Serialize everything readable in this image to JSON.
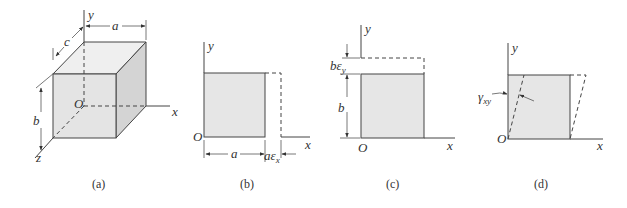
{
  "figures": [
    {
      "id": "a",
      "caption": "(a)",
      "description": "Unit cube with edges a, b, c aligned to x, y, z axes",
      "labels": {
        "y_axis": "y",
        "x_axis": "x",
        "z_axis": "z",
        "origin": "O",
        "dim_a": "a",
        "dim_b": "b",
        "dim_c": "c"
      }
    },
    {
      "id": "b",
      "caption": "(b)",
      "description": "Normal strain in x direction",
      "labels": {
        "y_axis": "y",
        "x_axis": "x",
        "origin": "O",
        "dim_a": "a",
        "elongation": "aε",
        "elongation_sub": "x"
      }
    },
    {
      "id": "c",
      "caption": "(c)",
      "description": "Normal strain in y direction",
      "labels": {
        "y_axis": "y",
        "x_axis": "x",
        "origin": "O",
        "dim_b": "b",
        "elongation": "bε",
        "elongation_sub": "y"
      }
    },
    {
      "id": "d",
      "caption": "(d)",
      "description": "Shear strain in xy plane",
      "labels": {
        "y_axis": "y",
        "x_axis": "x",
        "origin": "O",
        "shear": "γ",
        "shear_sub": "xy"
      }
    }
  ],
  "colors": {
    "face_front": "#e4e4e4",
    "face_top": "#efefef",
    "face_side": "#d2d2d2",
    "square_fill": "#e6e6e6",
    "line": "#444444"
  }
}
